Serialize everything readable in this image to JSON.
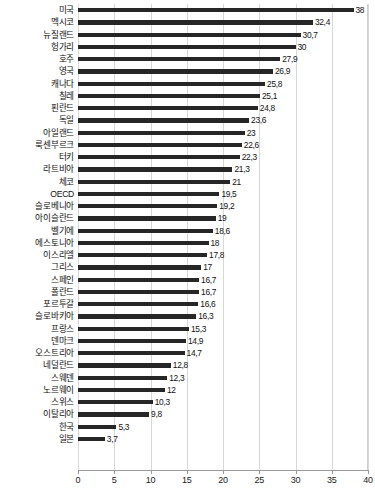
{
  "chart_data": {
    "type": "bar",
    "orientation": "horizontal",
    "title": "",
    "subtitle": "",
    "xlabel": "",
    "ylabel": "",
    "xlim": [
      0,
      40
    ],
    "xticks": [
      0,
      5,
      10,
      15,
      20,
      25,
      30,
      35,
      40
    ],
    "grid": true,
    "legend": null,
    "bar_color": "#262626",
    "categories": [
      "미국",
      "멕시코",
      "뉴질랜드",
      "헝가리",
      "호주",
      "영국",
      "캐나다",
      "칠레",
      "핀란드",
      "독일",
      "아일랜드",
      "룩센부르크",
      "터키",
      "라트비아",
      "체코",
      "OECD",
      "슬로베니아",
      "아이슬란드",
      "벨기에",
      "에스토니아",
      "이스라엘",
      "그리스",
      "스페인",
      "폴란드",
      "포르투갈",
      "슬로바키아",
      "프랑스",
      "덴마크",
      "오스트리아",
      "네덜란드",
      "스웨덴",
      "노르웨이",
      "스위스",
      "이탈리아",
      "한국",
      "일본"
    ],
    "values": [
      38,
      32.4,
      30.7,
      30,
      27.9,
      26.9,
      25.8,
      25.1,
      24.8,
      23.6,
      23,
      22.6,
      22.3,
      21.3,
      21,
      19.5,
      19.2,
      19,
      18.6,
      18,
      17.8,
      17,
      16.7,
      16.7,
      16.6,
      16.3,
      15.3,
      14.9,
      14.7,
      12.8,
      12.3,
      12,
      10.3,
      9.8,
      5.3,
      3.7
    ],
    "value_labels": [
      "38",
      "32,4",
      "30,7",
      "30",
      "27,9",
      "26,9",
      "25,8",
      "25,1",
      "24,8",
      "23,6",
      "23",
      "22,6",
      "22,3",
      "21,3",
      "21",
      "19,5",
      "19,2",
      "19",
      "18,6",
      "18",
      "17,8",
      "17",
      "16,7",
      "16,7",
      "16,6",
      "16,3",
      "15,3",
      "14,9",
      "14,7",
      "12,8",
      "12,3",
      "12",
      "10,3",
      "9,8",
      "5,3",
      "3,7"
    ]
  }
}
